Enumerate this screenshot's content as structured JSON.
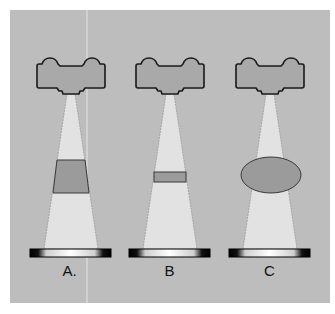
{
  "figure": {
    "background": "#bdbdbd",
    "panel": {
      "x": 10,
      "y": 10,
      "w": 320,
      "h": 293
    },
    "divider_x": 87,
    "colors": {
      "panel_bg": "#bdbdbd",
      "tube_fill": "#a9a9a9",
      "tube_stroke": "#1a1a1a",
      "beam_fill": "#e2e2e2",
      "beam_edge": "#8a8a8a",
      "object_fill": "#9b9b9b",
      "object_stroke": "#3a3a3a",
      "detector_dark": "#0a0a0a",
      "detector_light": "#ffffff"
    }
  },
  "panels": [
    {
      "id": "A",
      "label": "A.",
      "cx": 71,
      "object": {
        "shape": "trapezoid",
        "top_y": 160,
        "bottom_y": 193,
        "top_left": 57,
        "top_right": 85,
        "bottom_left": 53,
        "bottom_right": 89
      },
      "detector": {
        "x": 30,
        "y": 249,
        "w": 81,
        "h": 8
      }
    },
    {
      "id": "B",
      "label": "B",
      "cx": 170,
      "object": {
        "shape": "rectangle",
        "x": 154,
        "y": 172,
        "w": 32,
        "h": 10
      },
      "detector": {
        "x": 129,
        "y": 249,
        "w": 81,
        "h": 8
      }
    },
    {
      "id": "C",
      "label": "C",
      "cx": 270,
      "object": {
        "shape": "ellipse",
        "cx": 271,
        "cy": 175,
        "rx": 30,
        "ry": 18
      },
      "detector": {
        "x": 229,
        "y": 249,
        "w": 81,
        "h": 8
      }
    }
  ]
}
